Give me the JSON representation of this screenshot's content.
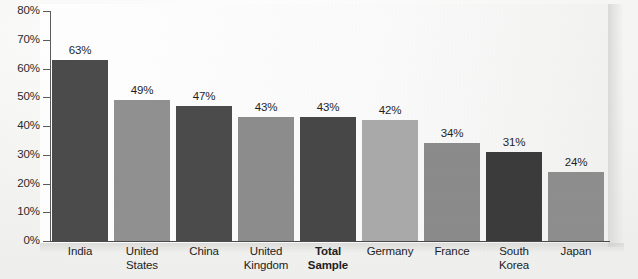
{
  "chart_data": {
    "type": "bar",
    "title": "",
    "subtitle": "",
    "xlabel": "",
    "ylabel": "",
    "ylim": [
      0,
      80
    ],
    "grid": false,
    "legend": "none",
    "y_tick_labels": [
      "80%",
      "70%",
      "60%",
      "50%",
      "40%",
      "30%",
      "20%",
      "10%",
      "0%"
    ],
    "y_tick_values": [
      80,
      70,
      60,
      50,
      40,
      30,
      20,
      10,
      0
    ],
    "categories": [
      "India",
      "United States",
      "China",
      "United Kingdom",
      "Total Sample",
      "Germany",
      "France",
      "South Korea",
      "Japan"
    ],
    "values": [
      63,
      49,
      47,
      43,
      43,
      42,
      34,
      31,
      24
    ],
    "data_labels": [
      "63%",
      "49%",
      "47%",
      "43%",
      "43%",
      "42%",
      "34%",
      "31%",
      "24%"
    ],
    "bars": [
      {
        "category_lines": [
          "India"
        ],
        "value": 63,
        "label": "63%",
        "color": "#4b4b4b",
        "bold_category": false
      },
      {
        "category_lines": [
          "United",
          "States"
        ],
        "value": 49,
        "label": "49%",
        "color": "#919191",
        "bold_category": false
      },
      {
        "category_lines": [
          "China"
        ],
        "value": 47,
        "label": "47%",
        "color": "#4b4b4b",
        "bold_category": false
      },
      {
        "category_lines": [
          "United",
          "Kingdom"
        ],
        "value": 43,
        "label": "43%",
        "color": "#8d8d8d",
        "bold_category": false
      },
      {
        "category_lines": [
          "Total",
          "Sample"
        ],
        "value": 43,
        "label": "43%",
        "color": "#474747",
        "bold_category": true
      },
      {
        "category_lines": [
          "Germany"
        ],
        "value": 42,
        "label": "42%",
        "color": "#aaaaaa",
        "bold_category": false
      },
      {
        "category_lines": [
          "France"
        ],
        "value": 34,
        "label": "34%",
        "color": "#8b8b8b",
        "bold_category": false
      },
      {
        "category_lines": [
          "South",
          "Korea"
        ],
        "value": 31,
        "label": "31%",
        "color": "#3b3b3b",
        "bold_category": false
      },
      {
        "category_lines": [
          "Japan"
        ],
        "value": 24,
        "label": "24%",
        "color": "#8e8e8e",
        "bold_category": false
      }
    ],
    "colors": {
      "dark_bar": "#4b4b4b",
      "darkest_bar": "#3b3b3b",
      "medium_bar": "#8e8e8e",
      "light_bar": "#aaaaaa",
      "axis": "#4a4a4a",
      "text": "#1f1f1f",
      "background": "#f7f7f6"
    }
  }
}
